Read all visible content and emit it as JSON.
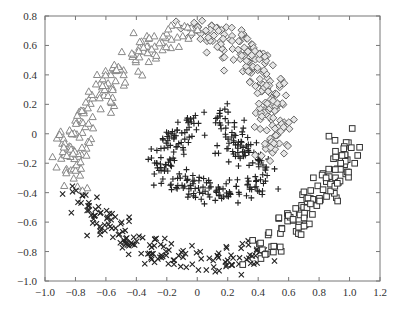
{
  "chart_data": {
    "type": "scatter",
    "title": "",
    "xlabel": "",
    "ylabel": "",
    "xlim": [
      -1.0,
      1.2
    ],
    "ylim": [
      -1.0,
      0.8
    ],
    "grid": false,
    "legend": null,
    "x_ticks": [
      -1.0,
      -0.8,
      -0.6,
      -0.4,
      -0.2,
      0,
      0.2,
      0.4,
      0.6,
      0.8,
      1.0,
      1.2
    ],
    "x_tick_labels": [
      "−1.0",
      "−0.8",
      "−0.6",
      "−0.4",
      "−0.2",
      "0",
      "0.2",
      "0.4",
      "0.6",
      "0.8",
      "1.0",
      "1.2"
    ],
    "y_ticks": [
      0.8,
      0.6,
      0.4,
      0.2,
      0,
      -0.2,
      -0.4,
      -0.6,
      -0.8,
      -1.0
    ],
    "y_tick_labels": [
      "0.8",
      "0.6",
      "0.4",
      "0.2",
      "0",
      "−0.2",
      "−0.4",
      "−0.6",
      "−0.8",
      "−1.0"
    ],
    "series": [
      {
        "name": "plus",
        "marker": "plus",
        "color": "#222222",
        "description": "inner spiral core",
        "path": [
          [
            0.1,
            0.1
          ],
          [
            0.2,
            0.1
          ],
          [
            0.25,
            0.0
          ],
          [
            0.2,
            -0.1
          ],
          [
            0.35,
            -0.12
          ],
          [
            0.45,
            -0.2
          ],
          [
            0.4,
            -0.35
          ],
          [
            0.25,
            -0.4
          ],
          [
            0.1,
            -0.4
          ],
          [
            -0.05,
            -0.35
          ],
          [
            -0.15,
            -0.3
          ],
          [
            -0.25,
            -0.25
          ],
          [
            -0.2,
            -0.1
          ],
          [
            -0.1,
            0.0
          ],
          [
            0.0,
            0.08
          ]
        ],
        "count": 260,
        "spread": 0.045
      },
      {
        "name": "diamond",
        "marker": "diamond",
        "color": "#666666",
        "description": "upper-right arm",
        "path": [
          [
            -0.05,
            0.7
          ],
          [
            0.1,
            0.68
          ],
          [
            0.25,
            0.62
          ],
          [
            0.35,
            0.52
          ],
          [
            0.42,
            0.4
          ],
          [
            0.47,
            0.28
          ],
          [
            0.5,
            0.15
          ],
          [
            0.5,
            0.02
          ],
          [
            0.48,
            -0.1
          ]
        ],
        "count": 200,
        "spread": 0.055
      },
      {
        "name": "triangle",
        "marker": "triangle",
        "color": "#888888",
        "description": "upper-left arm",
        "path": [
          [
            -0.05,
            0.7
          ],
          [
            -0.2,
            0.65
          ],
          [
            -0.35,
            0.58
          ],
          [
            -0.5,
            0.45
          ],
          [
            -0.62,
            0.3
          ],
          [
            -0.72,
            0.15
          ],
          [
            -0.8,
            0.0
          ],
          [
            -0.84,
            -0.15
          ],
          [
            -0.82,
            -0.3
          ]
        ],
        "count": 170,
        "spread": 0.055
      },
      {
        "name": "cross",
        "marker": "cross",
        "color": "#222222",
        "description": "lower-left arm",
        "path": [
          [
            -0.8,
            -0.38
          ],
          [
            -0.72,
            -0.5
          ],
          [
            -0.6,
            -0.62
          ],
          [
            -0.45,
            -0.72
          ],
          [
            -0.3,
            -0.8
          ],
          [
            -0.15,
            -0.84
          ],
          [
            0.0,
            -0.86
          ],
          [
            0.15,
            -0.86
          ],
          [
            0.3,
            -0.84
          ],
          [
            0.42,
            -0.8
          ]
        ],
        "count": 160,
        "spread": 0.055
      },
      {
        "name": "square",
        "marker": "square",
        "color": "#333333",
        "description": "lower-right arm",
        "path": [
          [
            0.42,
            -0.82
          ],
          [
            0.52,
            -0.74
          ],
          [
            0.62,
            -0.64
          ],
          [
            0.72,
            -0.52
          ],
          [
            0.8,
            -0.4
          ],
          [
            0.88,
            -0.28
          ],
          [
            0.95,
            -0.16
          ],
          [
            0.98,
            -0.05
          ],
          [
            0.95,
            0.0
          ]
        ],
        "count": 110,
        "spread": 0.055
      }
    ]
  },
  "plot_area": {
    "left": 45,
    "right": 380,
    "top": 16,
    "bottom": 281
  },
  "frame_color": "#777777"
}
